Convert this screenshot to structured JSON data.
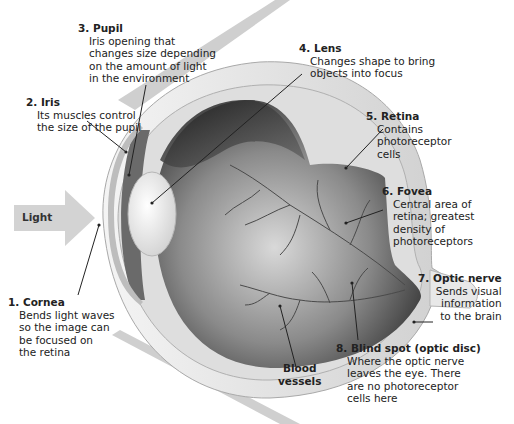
{
  "diagram": {
    "light_arrow": {
      "label": "Light"
    },
    "labels": [
      {
        "number": "1.",
        "name": "Cornea",
        "description": [
          "Bends light waves",
          "so the image can",
          "be focused on",
          "the retina"
        ]
      },
      {
        "number": "2.",
        "name": "Iris",
        "description": [
          "Its muscles control",
          "the size of the pupil"
        ]
      },
      {
        "number": "3.",
        "name": "Pupil",
        "description": [
          "Iris opening that",
          "changes size depending",
          "on the amount of light",
          "in the environment"
        ]
      },
      {
        "number": "4.",
        "name": "Lens",
        "description": [
          "Changes shape to bring",
          "objects into focus"
        ]
      },
      {
        "number": "5.",
        "name": "Retina",
        "description": [
          "Contains",
          "photoreceptor",
          "cells"
        ]
      },
      {
        "number": "6.",
        "name": "Fovea",
        "description": [
          "Central area of",
          "retina; greatest",
          "density of",
          "photoreceptors"
        ]
      },
      {
        "number": "7.",
        "name": "Optic nerve",
        "description": [
          "Sends visual",
          "information",
          "to the brain"
        ]
      },
      {
        "number": "8.",
        "name": "Blind spot (optic disc)",
        "description": [
          "Where the optic nerve",
          "leaves the eye. There",
          "are no photoreceptor",
          "cells here"
        ]
      }
    ],
    "unnumbered_labels": [
      {
        "name": "Blood vessels",
        "lines": [
          "Blood",
          "vessels"
        ]
      }
    ],
    "colors": {
      "sclera": "#e6e6e6",
      "interior_dark": "#3a3a3a",
      "lens": "#f2f2f2",
      "arrow": "#d0d0d0",
      "leader_line": "#222222"
    }
  }
}
